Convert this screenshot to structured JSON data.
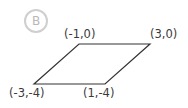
{
  "badge": {
    "label": "B",
    "color": "#cfcfcf"
  },
  "figure": {
    "shape": "parallelogram",
    "vertices": [
      {
        "label": "(-1,0)",
        "x": -1,
        "y": 0
      },
      {
        "label": "(3,0)",
        "x": 3,
        "y": 0
      },
      {
        "label": "(1,-4)",
        "x": 1,
        "y": -4
      },
      {
        "label": "(-3,-4)",
        "x": -3,
        "y": -4
      }
    ],
    "stroke_color": "#333333"
  }
}
